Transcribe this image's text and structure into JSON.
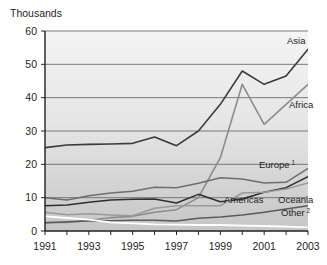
{
  "chart_data": {
    "type": "line",
    "title": "",
    "subtitle": "",
    "unit_title": "Thousands",
    "xlabel": "",
    "ylabel": "",
    "xlim": [
      1991,
      2003
    ],
    "ylim": [
      0,
      60
    ],
    "ytick_values": [
      0,
      10,
      20,
      30,
      40,
      50,
      60
    ],
    "ytick_labels": [
      "0",
      "10",
      "20",
      "30",
      "40",
      "50",
      "60"
    ],
    "xtick_values": [
      1991,
      1993,
      1995,
      1997,
      1999,
      2001,
      2003
    ],
    "xtick_labels": [
      "1991",
      "1993",
      "1995",
      "1997",
      "1999",
      "2001",
      "2003"
    ],
    "x": [
      1991,
      1992,
      1993,
      1994,
      1995,
      1996,
      1997,
      1998,
      1999,
      2000,
      2001,
      2002,
      2003
    ],
    "grid": "horizontal",
    "legend_position": "inline-right",
    "series": [
      {
        "name": "Asia",
        "label": "Asia",
        "color": "#3b3b3b",
        "width": 1.6,
        "values": [
          25.0,
          25.8,
          26.0,
          26.1,
          26.3,
          28.2,
          25.6,
          30.0,
          38.0,
          48.0,
          44.0,
          46.5,
          54.5
        ]
      },
      {
        "name": "Africa",
        "label": "Africa",
        "color": "#8c8c8c",
        "width": 1.6,
        "values": [
          2.5,
          2.6,
          3.2,
          4.0,
          4.4,
          5.6,
          6.4,
          10.0,
          22.0,
          44.0,
          32.0,
          38.0,
          44.0
        ]
      },
      {
        "name": "Europe",
        "label": "Europe",
        "superscript": "1",
        "color": "#6e6e6e",
        "width": 1.5,
        "values": [
          10.0,
          9.3,
          10.6,
          11.4,
          11.9,
          13.1,
          13.0,
          14.3,
          16.0,
          15.6,
          14.4,
          14.6,
          18.8
        ]
      },
      {
        "name": "Americas",
        "label": "Americas",
        "color": "#2e2e2e",
        "width": 1.5,
        "values": [
          7.6,
          7.8,
          8.6,
          9.3,
          9.5,
          9.6,
          8.4,
          11.0,
          8.8,
          9.6,
          11.6,
          13.0,
          16.3
        ]
      },
      {
        "name": "Oceania",
        "label": "Oceania",
        "color": "#9a9a9a",
        "width": 1.5,
        "values": [
          5.6,
          4.9,
          5.2,
          4.8,
          4.6,
          6.8,
          7.6,
          7.6,
          7.6,
          11.4,
          11.6,
          12.6,
          14.4
        ]
      },
      {
        "name": "Other",
        "label": "Other",
        "superscript": "2",
        "color": "#5a5a5a",
        "width": 1.5,
        "values": [
          2.5,
          2.8,
          3.0,
          3.1,
          3.2,
          3.2,
          3.0,
          3.8,
          4.2,
          4.8,
          5.6,
          6.6,
          7.6
        ]
      },
      {
        "name": "unlabeled-white",
        "label": "",
        "color": "#ffffff",
        "width": 1.8,
        "values": [
          4.4,
          3.9,
          3.4,
          2.6,
          2.3,
          2.0,
          1.9,
          1.8,
          1.8,
          1.6,
          1.5,
          1.3,
          1.1
        ]
      }
    ],
    "series_label_positions": [
      {
        "name": "Asia",
        "x": 287,
        "y": 44
      },
      {
        "name": "Africa",
        "x": 289,
        "y": 108
      },
      {
        "name": "Europe",
        "x": 259,
        "y": 168
      },
      {
        "name": "Americas",
        "x": 224,
        "y": 203
      },
      {
        "name": "Oceania",
        "x": 278,
        "y": 203
      },
      {
        "name": "Other",
        "x": 281,
        "y": 216
      }
    ],
    "style": {
      "plot_bg_top": "#f2f2f2",
      "plot_bg_bottom": "#c9c9c9",
      "gridline_color": "#6d6d6d",
      "axis_color": "#231f20",
      "page_bg": "#ffffff"
    }
  }
}
